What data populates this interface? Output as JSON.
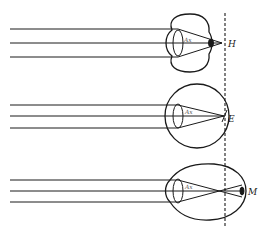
{
  "diagram": {
    "stroke_color": "#1a1a1a",
    "background": "#ffffff",
    "retina_reference_line": {
      "style": "dashed",
      "x": 225
    },
    "eyes": [
      {
        "id": "hyperopia",
        "label": "H",
        "axis_label": "Ax",
        "focus": "behind retina"
      },
      {
        "id": "emmetropia",
        "label": "E",
        "axis_label": "Ax",
        "focus": "on retina"
      },
      {
        "id": "myopia",
        "label": "M",
        "axis_label": "Ax",
        "focus": "in front of retina"
      }
    ]
  }
}
